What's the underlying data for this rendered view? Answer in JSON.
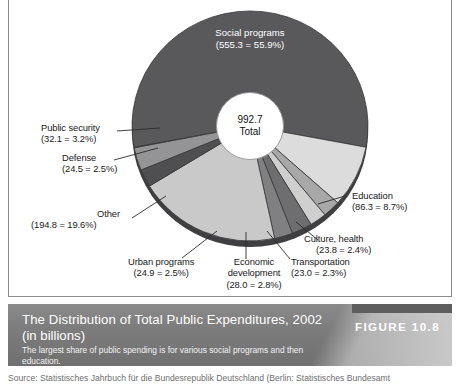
{
  "figure": {
    "number_label": "FIGURE 10.8",
    "title_line1": "The Distribution of Total Public Expenditures, 2002",
    "title_line2": "(in  billions)",
    "subtitle": "The largest share of public spending is for various social programs and then education.",
    "source": "Source:  Statistisches  Jahrbuch  für  die  Bundesrepublik  Deutschland  (Berlin:  Statistisches  Bundesamt"
  },
  "center": {
    "value": "992.7",
    "caption": "Total"
  },
  "chart_data": {
    "type": "pie",
    "title": "The Distribution of Total Public Expenditures, 2002 (in billions)",
    "total": 992.7,
    "unit": "billions",
    "legend": "labels-with-leader-lines",
    "grid": false,
    "categories": [
      "Social programs",
      "Education",
      "Culture, health",
      "Transportation",
      "Economic development",
      "Urban programs",
      "Other",
      "Defense",
      "Public security"
    ],
    "values": [
      555.3,
      86.3,
      23.8,
      23.0,
      28.0,
      24.9,
      194.8,
      24.5,
      32.1
    ],
    "percents": [
      55.9,
      8.7,
      2.4,
      2.3,
      2.8,
      2.5,
      19.6,
      2.5,
      3.2
    ],
    "colors": [
      "#59595b",
      "#dcdcdc",
      "#a8a8a8",
      "#cfcfcf",
      "#6e6e70",
      "#808082",
      "#c9c9c9",
      "#4f4f51",
      "#949496"
    ],
    "slices": [
      {
        "name": "Social programs",
        "value": 555.3,
        "percent": 55.9,
        "label": "Social programs",
        "sub": "(555.3 = 55.9%)",
        "color": "#59595b"
      },
      {
        "name": "Education",
        "value": 86.3,
        "percent": 8.7,
        "label": "Education",
        "sub": "(86.3 = 8.7%)",
        "color": "#dcdcdc"
      },
      {
        "name": "Culture, health",
        "value": 23.8,
        "percent": 2.4,
        "label": "Culture, health",
        "sub": "(23.8 = 2.4%)",
        "color": "#a8a8a8"
      },
      {
        "name": "Transportation",
        "value": 23.0,
        "percent": 2.3,
        "label": "Transportation",
        "sub": "(23.0 = 2.3%)",
        "color": "#cfcfcf"
      },
      {
        "name": "Economic development",
        "value": 28.0,
        "percent": 2.8,
        "label_line1": "Economic",
        "label_line2": "development",
        "sub": "(28.0 = 2.8%)",
        "color": "#6e6e70"
      },
      {
        "name": "Urban programs",
        "value": 24.9,
        "percent": 2.5,
        "label": "Urban programs",
        "sub": "(24.9 = 2.5%)",
        "color": "#808082"
      },
      {
        "name": "Other",
        "value": 194.8,
        "percent": 19.6,
        "label": "Other",
        "sub": "(194.8 = 19.6%)",
        "color": "#c9c9c9"
      },
      {
        "name": "Defense",
        "value": 24.5,
        "percent": 2.5,
        "label": "Defense",
        "sub": "(24.5 = 2.5%)",
        "color": "#4f4f51"
      },
      {
        "name": "Public security",
        "value": 32.1,
        "percent": 3.2,
        "label": "Public security",
        "sub": "(32.1 = 3.2%)",
        "color": "#949496"
      }
    ]
  },
  "labels": {
    "social_programs": {
      "line1": "Social programs",
      "line2": "(555.3 = 55.9%)"
    },
    "public_security": {
      "line1": "Public security",
      "line2": "(32.1 = 3.2%)"
    },
    "defense": {
      "line1": "Defense",
      "line2": "(24.5 = 2.5%)"
    },
    "other": {
      "line1": "Other",
      "line2": "(194.8 = 19.6%)"
    },
    "urban_programs": {
      "line1": "Urban programs",
      "line2": "(24.9 = 2.5%)"
    },
    "economic_development": {
      "line1": "Economic",
      "line1b": "development",
      "line2": "(28.0 = 2.8%)"
    },
    "transportation": {
      "line1": "Transportation",
      "line2": "(23.0 = 2.3%)"
    },
    "culture_health": {
      "line1": "Culture, health",
      "line2": "(23.8 = 2.4%)"
    },
    "education": {
      "line1": "Education",
      "line2": "(86.3 = 8.7%)"
    }
  }
}
